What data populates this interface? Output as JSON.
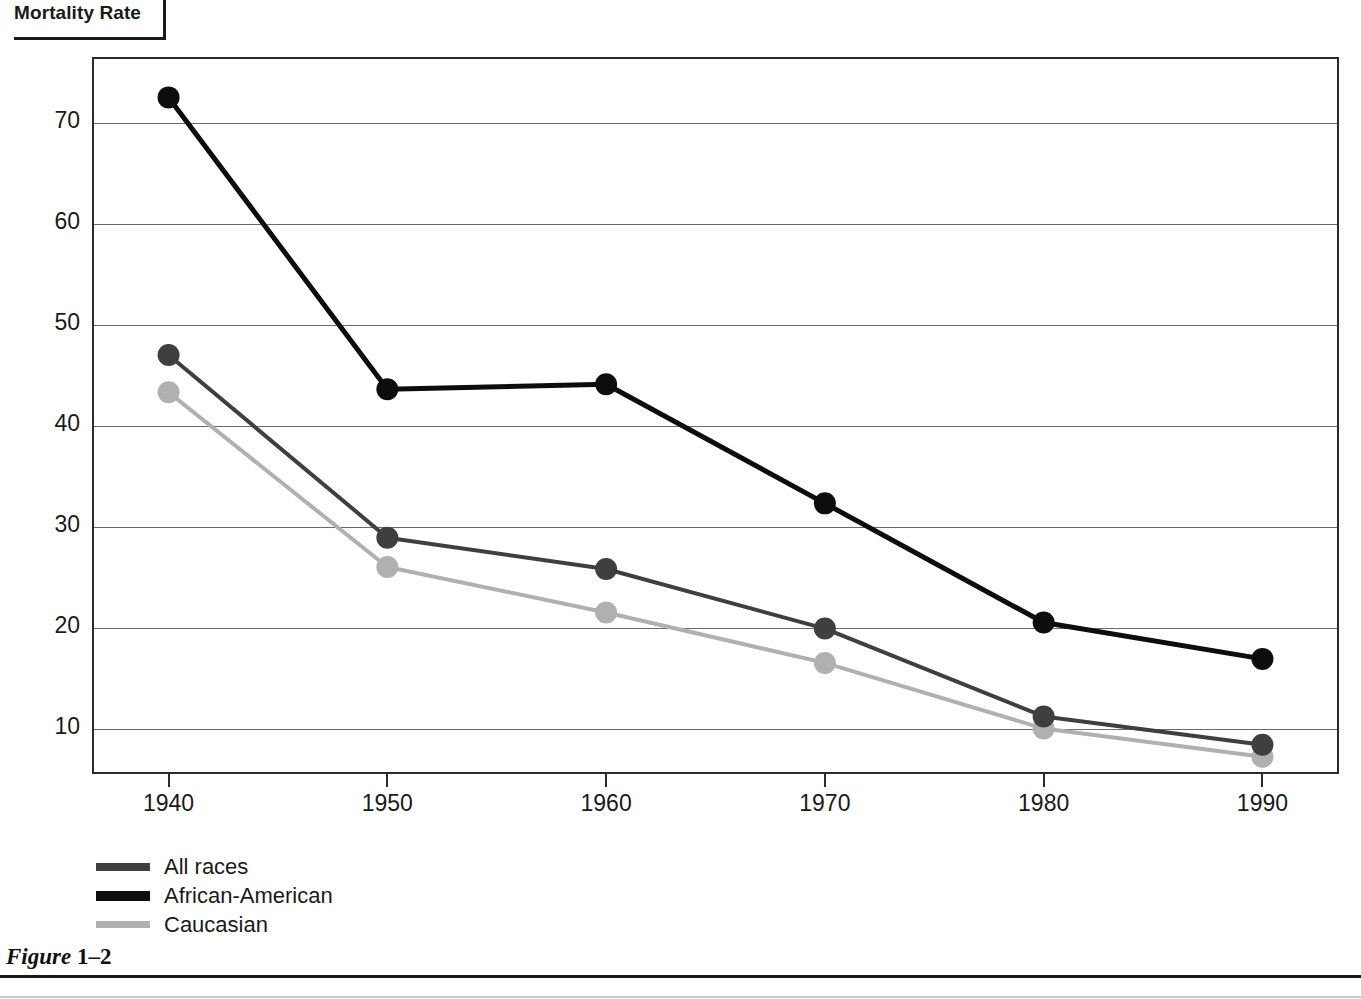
{
  "title": "Mortality Rate",
  "caption": {
    "prefix": "Figure",
    "number": "1–2"
  },
  "legend": {
    "items": [
      {
        "label": "All races",
        "color": "#3f3f3f"
      },
      {
        "label": "African-American",
        "color": "#0d0d0d"
      },
      {
        "label": "Caucasian",
        "color": "#b0b0b0"
      }
    ]
  },
  "chart_data": {
    "type": "line",
    "title": "Mortality Rate",
    "xlabel": "",
    "ylabel": "Mortality Rate",
    "x": [
      1940,
      1950,
      1960,
      1970,
      1980,
      1990
    ],
    "xtick_labels": [
      "1940",
      "1950",
      "1960",
      "1970",
      "1980",
      "1990"
    ],
    "ytick_labels": [
      "10",
      "20",
      "30",
      "40",
      "50",
      "60",
      "70"
    ],
    "yticks": [
      10,
      20,
      30,
      40,
      50,
      60,
      70
    ],
    "ylim": [
      5.3,
      76.3
    ],
    "xlim": [
      1936.5,
      1993.5
    ],
    "grid": "horizontal",
    "legend_position": "below-left",
    "markers": "filled-circle",
    "series": [
      {
        "name": "All races",
        "color": "#3f3f3f",
        "values": [
          46.8,
          28.7,
          25.6,
          19.7,
          11.0,
          8.2
        ]
      },
      {
        "name": "African-American",
        "color": "#0d0d0d",
        "values": [
          72.3,
          43.4,
          43.9,
          32.1,
          20.3,
          16.7
        ]
      },
      {
        "name": "Caucasian",
        "color": "#b0b0b0",
        "values": [
          43.1,
          25.8,
          21.3,
          16.3,
          9.8,
          7.0
        ]
      }
    ]
  }
}
